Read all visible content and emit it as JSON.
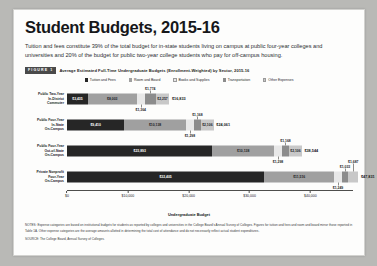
{
  "page": {
    "title": "Student Budgets, 2015-16",
    "subtitle": "Tuition and fees constitute 39% of the total budget for in-state students living on campus at public four-year colleges and universities and 20% of the budget for public two-year college students who pay for off-campus housing.",
    "figure_badge": "FIGURE 1",
    "figure_caption": "Average Estimated Full-Time Undergraduate Budgets (Enrollment-Weighted) by Sector, 2015-16",
    "notes": "NOTES: Expense categories are based on institutional budgets for students as reported by colleges and universities in the College Board's Annual Survey of Colleges. Figures for tuition and fees and room and board mirror those reported in Table 1A. Other expense categories are the average amounts allotted in determining the total cost of attendance and do not necessarily reflect actual student expenditures.",
    "source": "SOURCE: The College Board, Annual Survey of Colleges."
  },
  "colors": {
    "tuition": "#262626",
    "room": "#a0a0a0",
    "books": "#e8e8e8",
    "transport": "#8c8c8c",
    "other": "#c8c8c8",
    "page_bg": "#b9b9b6",
    "card_bg": "#fdfdfc",
    "badge_bg": "#4a4a4a"
  },
  "chart_data": {
    "type": "bar",
    "orientation": "horizontal",
    "stacked": true,
    "title": "Average Estimated Full-Time Undergraduate Budgets (Enrollment-Weighted) by Sector, 2015-16",
    "xlabel": "Undergraduate Budget",
    "ylabel": "",
    "xlim": [
      0,
      47000
    ],
    "xticks": [
      0,
      10000,
      20000,
      30000,
      40000
    ],
    "xticklabels": [
      "$0",
      "$10,000",
      "$20,000",
      "$30,000",
      "$40,000"
    ],
    "grid": false,
    "legend_position": "top-center",
    "categories": [
      "Public Two-Year In-District Commuter",
      "Public Four-Year In-State On-Campus",
      "Public Four-Year Out-of-State On-Campus",
      "Private Nonprofit Four-Year On-Campus"
    ],
    "series": [
      {
        "name": "Tuition and Fees",
        "color": "#262626",
        "values": [
          3435,
          9410,
          23893,
          32405
        ]
      },
      {
        "name": "Room and Board",
        "color": "#a0a0a0",
        "values": [
          8003,
          10138,
          10138,
          11516
        ]
      },
      {
        "name": "Books and Supplies",
        "color": "#e8e8e8",
        "values": [
          1364,
          1298,
          1298,
          1249
        ]
      },
      {
        "name": "Transportation",
        "color": "#8c8c8c",
        "values": [
          1774,
          1168,
          1168,
          1033
        ]
      },
      {
        "name": "Other Expenses",
        "color": "#c8c8c8",
        "values": [
          2257,
          2106,
          2106,
          1687
        ]
      }
    ],
    "totals": [
      16833,
      24061,
      38544,
      47831
    ],
    "total_labels": [
      "$16,833",
      "$24,061",
      "$38,544",
      "$47,831"
    ],
    "rows": [
      {
        "label_lines": [
          "Public Two-Year",
          "In-District",
          "Commuter"
        ],
        "segments": [
          {
            "name": "Tuition and Fees",
            "value": 3435,
            "label": "$3,435",
            "label_pos": "inside",
            "text": "light"
          },
          {
            "name": "Room and Board",
            "value": 8003,
            "label": "$8,003",
            "label_pos": "inside",
            "text": "dark"
          },
          {
            "name": "Books and Supplies",
            "value": 1364,
            "label": "$1,364",
            "label_pos": "below",
            "text": "dark"
          },
          {
            "name": "Transportation",
            "value": 1774,
            "label": "$1,774",
            "label_pos": "above",
            "text": "dark"
          },
          {
            "name": "Other Expenses",
            "value": 2257,
            "label": "$2,257",
            "label_pos": "inside",
            "text": "dark"
          }
        ],
        "total_label": "$16,833"
      },
      {
        "label_lines": [
          "Public Four-Year",
          "In-State",
          "On-Campus"
        ],
        "segments": [
          {
            "name": "Tuition and Fees",
            "value": 9410,
            "label": "$9,410",
            "label_pos": "inside",
            "text": "light"
          },
          {
            "name": "Room and Board",
            "value": 10138,
            "label": "$10,138",
            "label_pos": "inside",
            "text": "dark"
          },
          {
            "name": "Books and Supplies",
            "value": 1298,
            "label": "$1,298",
            "label_pos": "below",
            "text": "dark"
          },
          {
            "name": "Transportation",
            "value": 1168,
            "label": "$1,168",
            "label_pos": "above",
            "text": "dark"
          },
          {
            "name": "Other Expenses",
            "value": 2106,
            "label": "$2,106",
            "label_pos": "inside",
            "text": "dark"
          }
        ],
        "total_label": "$24,061"
      },
      {
        "label_lines": [
          "Public Four-Year",
          "Out-of-State",
          "On-Campus"
        ],
        "segments": [
          {
            "name": "Tuition and Fees",
            "value": 23893,
            "label": "$23,893",
            "label_pos": "inside",
            "text": "light"
          },
          {
            "name": "Room and Board",
            "value": 10138,
            "label": "$10,138",
            "label_pos": "inside",
            "text": "dark"
          },
          {
            "name": "Books and Supplies",
            "value": 1298,
            "label": "$1,298",
            "label_pos": "below",
            "text": "dark"
          },
          {
            "name": "Transportation",
            "value": 1168,
            "label": "$1,168",
            "label_pos": "above",
            "text": "dark"
          },
          {
            "name": "Other Expenses",
            "value": 2106,
            "label": "$2,106",
            "label_pos": "inside",
            "text": "dark"
          }
        ],
        "total_label": "$38,544"
      },
      {
        "label_lines": [
          "Private Nonprofit",
          "Four-Year",
          "On-Campus"
        ],
        "segments": [
          {
            "name": "Tuition and Fees",
            "value": 32405,
            "label": "$32,405",
            "label_pos": "inside",
            "text": "light"
          },
          {
            "name": "Room and Board",
            "value": 11516,
            "label": "$11,516",
            "label_pos": "inside",
            "text": "dark"
          },
          {
            "name": "Books and Supplies",
            "value": 1249,
            "label": "$1,249",
            "label_pos": "below",
            "text": "dark"
          },
          {
            "name": "Transportation",
            "value": 1033,
            "label": "$1,033",
            "label_pos": "above",
            "text": "dark"
          },
          {
            "name": "Other Expenses",
            "value": 1687,
            "label": "$1,687",
            "label_pos": "above2",
            "text": "dark"
          }
        ],
        "total_label": "$47,831"
      }
    ]
  }
}
